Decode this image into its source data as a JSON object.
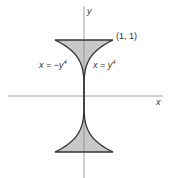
{
  "diagram": {
    "axes": {
      "x_label": "x",
      "y_label": "y",
      "origin_px": [
        84,
        96
      ],
      "x_scale_px_per_unit": 29,
      "y_scale_px_per_unit": 56,
      "x_axis_extent_px": [
        8,
        163
      ],
      "y_axis_extent_px": [
        6,
        178
      ]
    },
    "curves": [
      {
        "name": "left-curve",
        "equation_label": "x = −y⁴",
        "lhs": "x = −y",
        "exp": "4"
      },
      {
        "name": "right-curve",
        "equation_label": "x = y⁴",
        "lhs": "x = y",
        "exp": "4"
      }
    ],
    "point_label": "(1, 1)",
    "region": {
      "description": "Region bounded by x = −y⁴ and x = y⁴ for −1 ≤ y ≤ 1",
      "y_range": [
        -1,
        1
      ]
    },
    "colors": {
      "fill": "#c8c8c8",
      "curve": "#333333",
      "axis": "#888888",
      "text": "#333333"
    }
  }
}
